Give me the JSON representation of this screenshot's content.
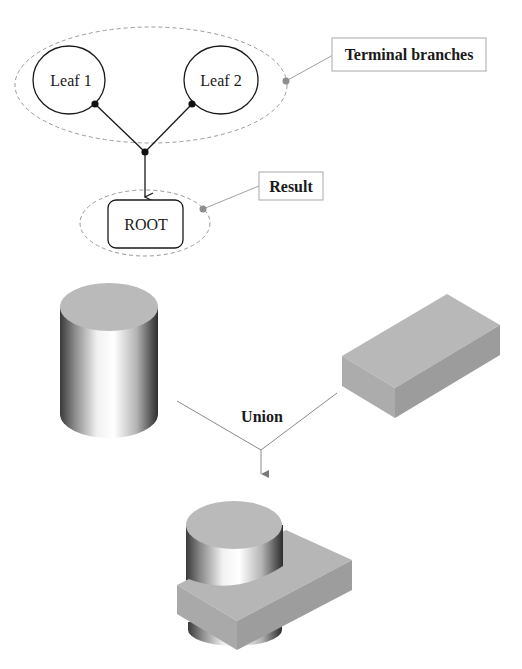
{
  "tree": {
    "leaves": [
      {
        "id": "leaf1",
        "label": "Leaf 1"
      },
      {
        "id": "leaf2",
        "label": "Leaf 2"
      }
    ],
    "root": {
      "label": "ROOT"
    },
    "callouts": {
      "terminal": "Terminal branches",
      "result": "Result"
    }
  },
  "csg": {
    "operation": "Union",
    "operands": [
      "cylinder",
      "box"
    ],
    "result": "cylinder-box-union"
  },
  "colors": {
    "stroke": "#1a1a1a",
    "dashed": "#9a9a9a",
    "callout_dot": "#8e8e8e",
    "callout_line": "#a0a0a0",
    "solid_top": "#b8b8b8",
    "solid_side": "#a6a6a6",
    "solid_dark": "#999999"
  }
}
